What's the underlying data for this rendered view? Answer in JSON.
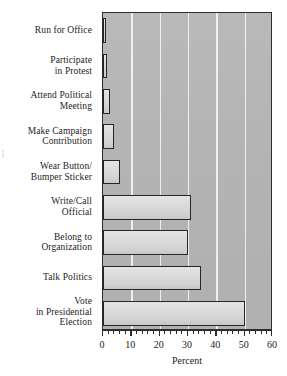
{
  "chart_data": {
    "type": "bar",
    "orientation": "horizontal",
    "title": "",
    "xlabel": "Percent",
    "ylabel": "",
    "xlim": [
      0,
      60
    ],
    "ylim": null,
    "grid": true,
    "grid_axis": "x",
    "legend": null,
    "xticks": [
      0,
      10,
      20,
      30,
      40,
      50,
      60
    ],
    "xtick_labels": [
      "0",
      "10",
      "20",
      "30",
      "40",
      "50",
      "60"
    ],
    "minor_tick_interval": 2,
    "categories": [
      "Run for Office",
      "Participate\nin Protest",
      "Attend Political\nMeeting",
      "Make Campaign\nContribution",
      "Wear Button/\nBumper Sticker",
      "Write/Call\nOfficial",
      "Belong to\nOrganization",
      "Talk Politics",
      "Vote\nin Presidential\nElection"
    ],
    "values": [
      1,
      1.5,
      2.5,
      4,
      6,
      31,
      30,
      34.5,
      50
    ],
    "colors": {
      "plot_background": "#b4b4b4",
      "gridline": "#f2f2f2",
      "bar_fill": "#dcdcdc",
      "bar_border": "#262626",
      "text": "#1c1c1c"
    }
  },
  "artifact": {
    "margin_mark": "|"
  }
}
